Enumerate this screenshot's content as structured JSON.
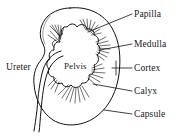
{
  "diagram": {
    "style": "line-drawing",
    "stroke_color": "#111111",
    "background_color": "#ffffff",
    "labels": {
      "papilla": "Papilla",
      "medulla": "Medulla",
      "cortex": "Cortex",
      "calyx": "Calyx",
      "capsule": "Capsule",
      "ureter": "Ureter",
      "pelvis": "Pelvis"
    }
  }
}
